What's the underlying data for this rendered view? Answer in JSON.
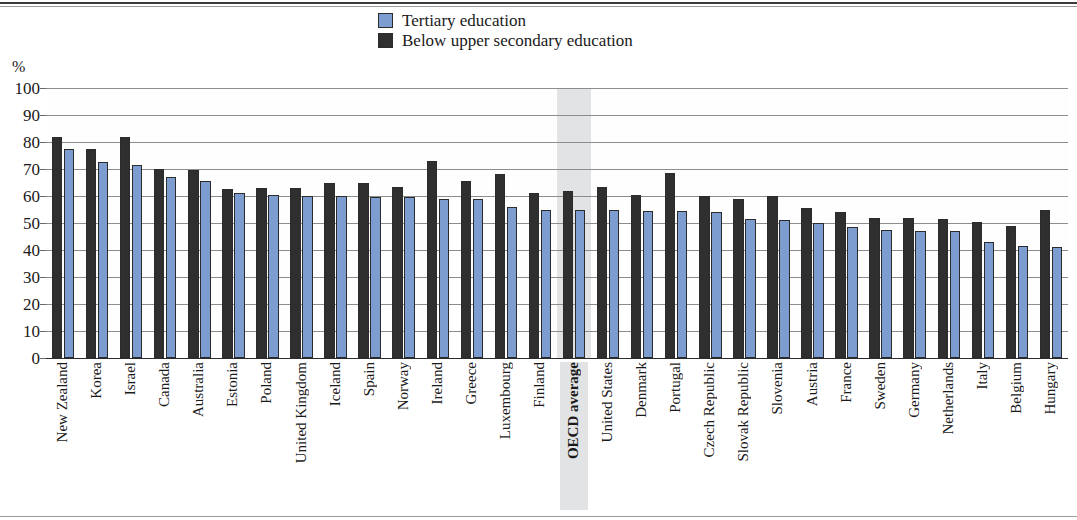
{
  "axis": {
    "unit_label": "%",
    "y_ticks": [
      0,
      10,
      20,
      30,
      40,
      50,
      60,
      70,
      80,
      90,
      100
    ],
    "y_min": 0,
    "y_max": 100
  },
  "legend": {
    "items": [
      {
        "label": "Tertiary education",
        "color": "#7d9dd0",
        "icon": "legend-swatch-tertiary"
      },
      {
        "label": "Below upper secondary education",
        "color": "#2f2f2f",
        "icon": "legend-swatch-below"
      }
    ]
  },
  "highlight": {
    "category": "OECD average",
    "color": "#e2e3e5"
  },
  "chart_data": {
    "type": "bar",
    "title": "",
    "subtitle": "",
    "xlabel": "",
    "ylabel": "%",
    "ylim": [
      0,
      100
    ],
    "grid": true,
    "legend_position": "top-center",
    "bar_order": [
      "Below upper secondary education",
      "Tertiary education"
    ],
    "categories": [
      "New Zealand",
      "Korea",
      "Israel",
      "Canada",
      "Australia",
      "Estonia",
      "Poland",
      "United Kingdom",
      "Iceland",
      "Spain",
      "Norway",
      "Ireland",
      "Greece",
      "Luxembourg",
      "Finland",
      "OECD average",
      "United States",
      "Denmark",
      "Portugal",
      "Czech Republic",
      "Slovak Republic",
      "Slovenia",
      "Austria",
      "France",
      "Sweden",
      "Germany",
      "Netherlands",
      "Italy",
      "Belgium",
      "Hungary"
    ],
    "series": [
      {
        "name": "Below upper secondary education",
        "color": "#2f2f2f",
        "values": [
          82,
          77.5,
          82,
          70,
          69.5,
          62.5,
          63,
          63,
          65,
          65,
          63.5,
          73,
          65.5,
          68,
          61,
          62,
          63.5,
          60.5,
          68.5,
          60,
          59,
          60,
          55.5,
          54,
          52,
          52,
          51.5,
          50.5,
          49,
          55
        ]
      },
      {
        "name": "Tertiary education",
        "color": "#7d9dd0",
        "values": [
          77.5,
          72.5,
          71.5,
          67,
          65.5,
          61,
          60.5,
          60,
          60,
          59.5,
          59.5,
          59,
          59,
          56,
          55,
          55,
          55,
          54.5,
          54.5,
          54,
          51.5,
          51,
          50,
          48.5,
          47.5,
          47,
          47,
          43,
          41.5,
          41
        ]
      }
    ]
  }
}
